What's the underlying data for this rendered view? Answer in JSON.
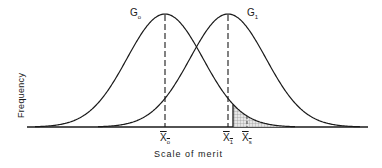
{
  "figure": {
    "type": "overlapping normal distributions",
    "xlabel": "Scale of merit",
    "ylabel": "Frequency",
    "curves": [
      {
        "name": "G0",
        "label_main": "G",
        "label_sub": "o",
        "mean_label": "X",
        "mean_sub": "o"
      },
      {
        "name": "G1",
        "label_main": "G",
        "label_sub": "1",
        "mean_label": "X",
        "mean_sub": "1"
      }
    ],
    "selection_mean": {
      "label_main": "X",
      "label_sub": "s"
    },
    "shaded_region": "upper tail of G0 beyond cutoff (selected individuals)",
    "colors": {
      "line": "#1a1a1a",
      "shade": "#9a9a9a",
      "background": "#ffffff"
    }
  }
}
